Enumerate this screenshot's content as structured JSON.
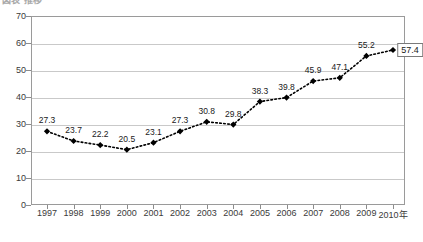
{
  "title": {
    "text": "図表 推移",
    "cropped": true
  },
  "chart_data": {
    "type": "line",
    "title": "",
    "xlabel": "",
    "ylabel": "",
    "categories": [
      "1997",
      "1998",
      "1999",
      "2000",
      "2001",
      "2002",
      "2003",
      "2004",
      "2005",
      "2006",
      "2007",
      "2008",
      "2009",
      "2010年"
    ],
    "values": [
      27.3,
      23.7,
      22.2,
      20.5,
      23.1,
      27.3,
      30.8,
      29.8,
      38.3,
      39.8,
      45.9,
      47.1,
      55.2,
      57.4
    ],
    "data_labels": [
      "27.3",
      "23.7",
      "22.2",
      "20.5",
      "23.1",
      "27.3",
      "30.8",
      "29.8",
      "38.3",
      "39.8",
      "45.9",
      "47.1",
      "55.2",
      "57.4"
    ],
    "highlighted_label_index": 13,
    "ylim": [
      0,
      70
    ],
    "y_ticks": [
      0,
      10,
      20,
      30,
      40,
      50,
      60,
      70
    ],
    "y_tick_labels": [
      "0",
      "10",
      "20",
      "30",
      "40",
      "50",
      "60",
      "70"
    ],
    "grid": "horizontal",
    "legend": "none",
    "series_color": "#000000",
    "grid_color": "#c9c9c9",
    "frame_color": "#9a9a9a",
    "line_style": "dotted",
    "marker": "diamond"
  }
}
